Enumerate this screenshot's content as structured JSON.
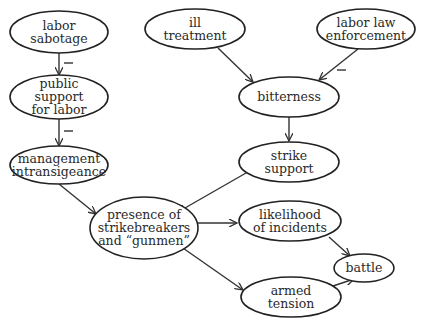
{
  "diagram": {
    "type": "causal-loop",
    "nodes": [
      {
        "id": "labor_sabotage",
        "lines": [
          "labor",
          "sabotage"
        ],
        "cx": 59,
        "cy": 32,
        "rx": 49,
        "ry": 21
      },
      {
        "id": "public_support",
        "lines": [
          "public",
          "support",
          "for labor"
        ],
        "cx": 59,
        "cy": 97,
        "rx": 49,
        "ry": 22
      },
      {
        "id": "management_intransigeance",
        "lines": [
          "management",
          "intransigeance"
        ],
        "cx": 59,
        "cy": 165,
        "rx": 49,
        "ry": 19
      },
      {
        "id": "ill_treatment",
        "lines": [
          "ill",
          "treatment"
        ],
        "cx": 195,
        "cy": 29,
        "rx": 50,
        "ry": 20
      },
      {
        "id": "labor_law_enforcement",
        "lines": [
          "labor law",
          "enforcement"
        ],
        "cx": 366,
        "cy": 29,
        "rx": 49,
        "ry": 20
      },
      {
        "id": "bitterness",
        "lines": [
          "bitterness"
        ],
        "cx": 289,
        "cy": 97,
        "rx": 50,
        "ry": 20
      },
      {
        "id": "strike_support",
        "lines": [
          "strike",
          "support"
        ],
        "cx": 289,
        "cy": 162,
        "rx": 50,
        "ry": 20
      },
      {
        "id": "strikebreakers",
        "lines": [
          "presence of",
          "strikebreakers",
          "and “gunmen”"
        ],
        "cx": 144,
        "cy": 228,
        "rx": 54,
        "ry": 31
      },
      {
        "id": "likelihood_incidents",
        "lines": [
          "likelihood",
          "of incidents"
        ],
        "cx": 290,
        "cy": 221,
        "rx": 51,
        "ry": 20
      },
      {
        "id": "battle",
        "lines": [
          "battle"
        ],
        "cx": 364,
        "cy": 268,
        "rx": 30,
        "ry": 14
      },
      {
        "id": "armed_tension",
        "lines": [
          "armed",
          "tension"
        ],
        "cx": 291,
        "cy": 297,
        "rx": 50,
        "ry": 20
      }
    ],
    "edges": [
      {
        "from": "labor_sabotage",
        "to": "public_support",
        "sign": "negative",
        "x1": 59,
        "y1": 53,
        "x2": 59,
        "y2": 75,
        "signx": 64,
        "signy": 63
      },
      {
        "from": "public_support",
        "to": "management_intransigeance",
        "sign": "negative",
        "x1": 59,
        "y1": 119,
        "x2": 59,
        "y2": 146,
        "signx": 64,
        "signy": 131
      },
      {
        "from": "management_intransigeance",
        "to": "strikebreakers",
        "sign": "positive",
        "x1": 59,
        "y1": 184,
        "x2": 96,
        "y2": 214
      },
      {
        "from": "ill_treatment",
        "to": "bitterness",
        "sign": "positive",
        "x1": 218,
        "y1": 48,
        "x2": 253,
        "y2": 82
      },
      {
        "from": "labor_law_enforcement",
        "to": "bitterness",
        "sign": "negative",
        "x1": 358,
        "y1": 49,
        "x2": 319,
        "y2": 80,
        "signx": 337,
        "signy": 70
      },
      {
        "from": "bitterness",
        "to": "strike_support",
        "sign": "positive",
        "x1": 289,
        "y1": 117,
        "x2": 289,
        "y2": 141
      },
      {
        "from": "strike_support",
        "to": "strikebreakers",
        "sign": "positive",
        "x1": 246,
        "y1": 173,
        "x2": 178,
        "y2": 212
      },
      {
        "from": "strikebreakers",
        "to": "likelihood_incidents",
        "sign": "positive",
        "x1": 198,
        "y1": 223,
        "x2": 237,
        "y2": 223
      },
      {
        "from": "strikebreakers",
        "to": "armed_tension",
        "sign": "positive",
        "x1": 180,
        "y1": 246,
        "x2": 243,
        "y2": 290
      },
      {
        "from": "likelihood_incidents",
        "to": "battle",
        "sign": "positive",
        "x1": 329,
        "y1": 237,
        "x2": 350,
        "y2": 256
      },
      {
        "from": "armed_tension",
        "to": "battle",
        "sign": "positive",
        "x1": 333,
        "y1": 286,
        "x2": 354,
        "y2": 279
      }
    ],
    "negative_sign_glyph": "—"
  }
}
